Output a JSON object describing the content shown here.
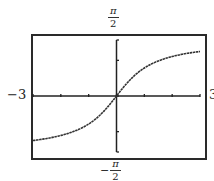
{
  "chart_data": {
    "type": "line",
    "title": "",
    "function": "y = arctan(x)",
    "xlabel": "",
    "ylabel": "",
    "xlim": [
      -3,
      3
    ],
    "ylim": [
      -1.5708,
      1.5708
    ],
    "x_ticks": [
      -3,
      -2,
      -1,
      0,
      1,
      2,
      3
    ],
    "y_ticks": [
      -1,
      0,
      1
    ],
    "grid": false,
    "legend": null,
    "labels": {
      "x_min": "−3",
      "x_max": "3",
      "y_max_num": "π",
      "y_max_den": "2",
      "y_min_sign": "−",
      "y_min_num": "π",
      "y_min_den": "2"
    },
    "series": [
      {
        "name": "arctan(x)",
        "x": [
          -3,
          -2.5,
          -2,
          -1.5,
          -1,
          -0.5,
          0,
          0.5,
          1,
          1.5,
          2,
          2.5,
          3
        ],
        "y": [
          -1.249,
          -1.19,
          -1.107,
          -0.983,
          -0.785,
          -0.464,
          0,
          0.464,
          0.785,
          0.983,
          1.107,
          1.19,
          1.249
        ]
      }
    ]
  },
  "colors": {
    "frame": "#2a2a2a",
    "axis": "#222222",
    "curve": "#333333",
    "background": "#ffffff"
  }
}
